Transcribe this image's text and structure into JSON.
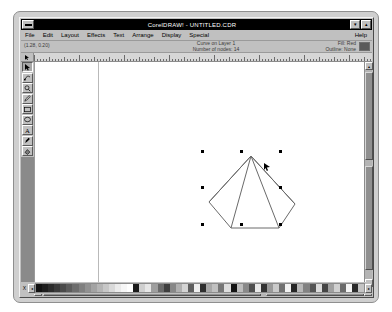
{
  "window": {
    "title": "CorelDRAW! - UNTITLED.CDR",
    "system_menu": "system-menu",
    "minimize_label": "▾",
    "maximize_label": "▴"
  },
  "menubar": {
    "items": [
      {
        "label": "File"
      },
      {
        "label": "Edit"
      },
      {
        "label": "Layout"
      },
      {
        "label": "Effects"
      },
      {
        "label": "Text"
      },
      {
        "label": "Arrange"
      },
      {
        "label": "Display"
      },
      {
        "label": "Special"
      }
    ],
    "help_label": "Help"
  },
  "statusbar": {
    "coordinates": "(1.28, 0.20)",
    "object_info": "Curve on Layer 1",
    "node_info": "Number of nodes: 14",
    "fill_label": "Fill: Red",
    "outline_label": "Outline: None",
    "fill_color": "#5a5a5a"
  },
  "toolbox": {
    "tools": [
      {
        "name": "pick-tool",
        "selected": true
      },
      {
        "name": "shape-tool",
        "selected": false
      },
      {
        "name": "zoom-tool",
        "selected": false
      },
      {
        "name": "pencil-tool",
        "selected": false
      },
      {
        "name": "rectangle-tool",
        "selected": false
      },
      {
        "name": "ellipse-tool",
        "selected": false
      },
      {
        "name": "text-tool",
        "selected": false
      },
      {
        "name": "outline-pen-tool",
        "selected": false
      },
      {
        "name": "fill-tool",
        "selected": false
      }
    ]
  },
  "scrollbars": {
    "up_arrow": "▴",
    "down_arrow": "▾",
    "left_arrow": "◂",
    "right_arrow": "▸"
  },
  "palette": {
    "close_label": "X",
    "scroll_left": "◂",
    "scroll_right": "▸",
    "colors": [
      "#111111",
      "#1d1d1d",
      "#2b2b2b",
      "#3a3a3a",
      "#4a4a4a",
      "#5b5b5b",
      "#6d6d6d",
      "#7f7f7f",
      "#919191",
      "#a3a3a3",
      "#b5b5b5",
      "#c7c7c7",
      "#d9d9d9",
      "#ebebeb",
      "#f7f7f7",
      "#ffffff",
      "#1a1a1a",
      "#cfcfcf",
      "#e6e6e6",
      "#9e9e9e",
      "#6a6a6a",
      "#3f3f3f",
      "#878787",
      "#b0b0b0",
      "#d4d4d4",
      "#5e5e5e",
      "#efefef",
      "#2f2f2f",
      "#a8a8a8",
      "#c0c0c0",
      "#767676",
      "#dedede",
      "#141414",
      "#bdbdbd",
      "#898989",
      "#4f4f4f",
      "#e9e9e9",
      "#343434",
      "#9a9a9a",
      "#cacaca",
      "#707070",
      "#f2f2f2",
      "#262626",
      "#b8b8b8",
      "#828282",
      "#555555",
      "#dcdcdc",
      "#454545",
      "#a0a0a0",
      "#d0d0d0",
      "#6b6b6b",
      "#f5f5f5",
      "#2a2a2a",
      "#c4c4c4"
    ]
  },
  "canvas": {
    "cursor_x": 243,
    "cursor_y": 145,
    "shape": {
      "name": "fan-polygon",
      "stroke_color": "#6a6a6a",
      "fill_color": "#ffffff",
      "points": "48,4 6,50 28,76 76,76 92,52",
      "spokes": [
        "48,4 6,50",
        "48,4 28,76",
        "48,4 76,76",
        "48,4 92,52"
      ],
      "bbox": {
        "x": 182,
        "y": 134,
        "w": 78,
        "h": 76
      }
    },
    "selection_handles": [
      {
        "x": 180,
        "y": 132,
        "type": "corner"
      },
      {
        "x": 219,
        "y": 132,
        "type": "corner"
      },
      {
        "x": 258,
        "y": 132,
        "type": "corner"
      },
      {
        "x": 180,
        "y": 168,
        "type": "corner"
      },
      {
        "x": 258,
        "y": 168,
        "type": "corner"
      },
      {
        "x": 180,
        "y": 205,
        "type": "corner"
      },
      {
        "x": 219,
        "y": 205,
        "type": "corner"
      },
      {
        "x": 258,
        "y": 205,
        "type": "corner"
      }
    ]
  }
}
